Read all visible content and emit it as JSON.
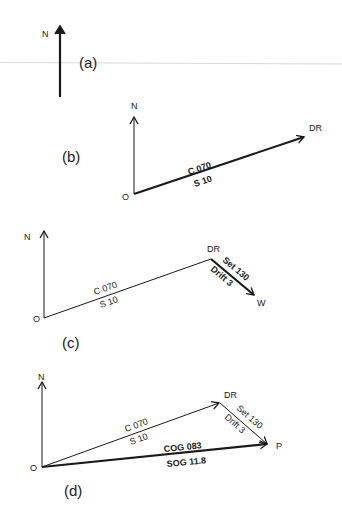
{
  "figure": {
    "colors": {
      "ink": "#1a1a1a",
      "background": "#ffffff",
      "rule": "#cfcfcf"
    }
  },
  "panels": {
    "a": {
      "label": "(a)",
      "north_label": "N"
    },
    "b": {
      "label": "(b)",
      "north_label": "N",
      "origin_label": "O",
      "dr_label": "DR",
      "course": "C 070",
      "speed": "S  10"
    },
    "c": {
      "label": "(c)",
      "north_label": "N",
      "origin_label": "O",
      "dr_label": "DR",
      "course": "C 070",
      "speed": "S  10",
      "set": "Set 130",
      "drift": "Drift 3",
      "end_label": "W"
    },
    "d": {
      "label": "(d)",
      "north_label": "N",
      "origin_label": "O",
      "dr_label": "DR",
      "course": "C 070",
      "speed": "S  10",
      "set": "Set 130",
      "drift": "Drift 3",
      "end_label": "P",
      "cog": "COG 083",
      "sog": "SOG 11.8"
    }
  }
}
